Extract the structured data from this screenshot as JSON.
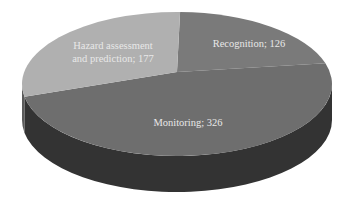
{
  "chart_data": {
    "type": "pie",
    "style": "3d",
    "title": "",
    "slices": [
      {
        "label": "Recognition",
        "value": 126,
        "display": "Recognition; 126",
        "color": "#7a7a7a",
        "side_color": "#3a3a3a"
      },
      {
        "label": "Monitoring",
        "value": 326,
        "display": "Monitoring; 326",
        "color": "#6e6e6e",
        "side_color": "#333333"
      },
      {
        "label": "Hazard assessment and prediction",
        "value": 177,
        "display_lines": [
          "Hazard assessment",
          "and prediction; 177"
        ],
        "color": "#b0b0b0",
        "side_color": "#5a5a5a"
      }
    ],
    "legend": "none",
    "label_color": "#ececec"
  }
}
